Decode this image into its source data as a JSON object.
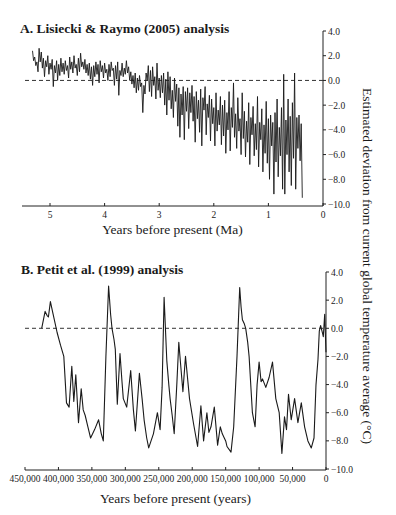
{
  "ylabel": "Estimated deviation from current global temperature average (°C)",
  "chart_data": [
    {
      "type": "line",
      "title": "A. Lisiecki & Raymo (2005) analysis",
      "xlabel": "Years before present (Ma)",
      "ylabel": "Estimated deviation from current global temperature average (°C)",
      "xlim": [
        5.5,
        0
      ],
      "ylim": [
        -10.0,
        4.0
      ],
      "xticks": [
        5,
        4,
        3,
        2,
        1,
        0
      ],
      "xtick_labels": [
        "5",
        "4",
        "3",
        "2",
        "1",
        "0"
      ],
      "yticks": [
        4.0,
        2.0,
        0.0,
        -2.0,
        -4.0,
        -6.0,
        -8.0,
        -10.0
      ],
      "ytick_labels": [
        "4.0",
        "2.0",
        "0.0",
        "−2.0",
        "−4.0",
        "−6.0",
        "−8.0",
        "−10.0"
      ],
      "reference_line": {
        "y": 0.0,
        "style": "dashed"
      },
      "grid": false,
      "series": [
        {
          "name": "Lisiecki & Raymo (2005)",
          "x": [
            5.32,
            5.3,
            5.28,
            5.26,
            5.24,
            5.22,
            5.2,
            5.18,
            5.16,
            5.14,
            5.12,
            5.1,
            5.08,
            5.06,
            5.04,
            5.02,
            5.0,
            4.98,
            4.96,
            4.94,
            4.92,
            4.9,
            4.88,
            4.86,
            4.84,
            4.82,
            4.8,
            4.78,
            4.76,
            4.74,
            4.72,
            4.7,
            4.68,
            4.66,
            4.64,
            4.62,
            4.6,
            4.58,
            4.56,
            4.54,
            4.52,
            4.5,
            4.48,
            4.46,
            4.44,
            4.42,
            4.4,
            4.38,
            4.36,
            4.34,
            4.32,
            4.3,
            4.28,
            4.26,
            4.24,
            4.22,
            4.2,
            4.18,
            4.16,
            4.14,
            4.12,
            4.1,
            4.08,
            4.06,
            4.04,
            4.02,
            4.0,
            3.98,
            3.96,
            3.94,
            3.92,
            3.9,
            3.88,
            3.86,
            3.84,
            3.82,
            3.8,
            3.78,
            3.76,
            3.74,
            3.72,
            3.7,
            3.68,
            3.66,
            3.64,
            3.62,
            3.6,
            3.58,
            3.56,
            3.54,
            3.52,
            3.5,
            3.48,
            3.46,
            3.44,
            3.42,
            3.4,
            3.38,
            3.36,
            3.34,
            3.32,
            3.3,
            3.28,
            3.26,
            3.24,
            3.22,
            3.2,
            3.18,
            3.16,
            3.14,
            3.12,
            3.1,
            3.08,
            3.06,
            3.04,
            3.02,
            3.0,
            2.98,
            2.96,
            2.94,
            2.92,
            2.9,
            2.88,
            2.86,
            2.84,
            2.82,
            2.8,
            2.78,
            2.76,
            2.74,
            2.72,
            2.7,
            2.68,
            2.66,
            2.64,
            2.62,
            2.6,
            2.58,
            2.56,
            2.54,
            2.52,
            2.5,
            2.48,
            2.46,
            2.44,
            2.42,
            2.4,
            2.38,
            2.36,
            2.34,
            2.32,
            2.3,
            2.28,
            2.26,
            2.24,
            2.22,
            2.2,
            2.18,
            2.16,
            2.14,
            2.12,
            2.1,
            2.08,
            2.06,
            2.04,
            2.02,
            2.0,
            1.98,
            1.96,
            1.94,
            1.92,
            1.9,
            1.88,
            1.86,
            1.84,
            1.82,
            1.8,
            1.78,
            1.76,
            1.74,
            1.72,
            1.7,
            1.68,
            1.66,
            1.64,
            1.62,
            1.6,
            1.58,
            1.56,
            1.54,
            1.52,
            1.5,
            1.48,
            1.46,
            1.44,
            1.42,
            1.4,
            1.38,
            1.36,
            1.34,
            1.32,
            1.3,
            1.28,
            1.26,
            1.24,
            1.22,
            1.2,
            1.18,
            1.16,
            1.14,
            1.12,
            1.1,
            1.08,
            1.06,
            1.04,
            1.02,
            1.0,
            0.98,
            0.96,
            0.94,
            0.92,
            0.9,
            0.88,
            0.86,
            0.84,
            0.82,
            0.8,
            0.78,
            0.76,
            0.74,
            0.72,
            0.7,
            0.68,
            0.66,
            0.64,
            0.62,
            0.6,
            0.58,
            0.56,
            0.54,
            0.52,
            0.5,
            0.48,
            0.46,
            0.44,
            0.42,
            0.4,
            0.38,
            0.36,
            0.34,
            0.32,
            0.3,
            0.28,
            0.26,
            0.24,
            0.22,
            0.2,
            0.18,
            0.16,
            0.14,
            0.12,
            0.1,
            0.08,
            0.06,
            0.04,
            0.02,
            0.0
          ],
          "y": [
            2.4,
            1.6,
            1.9,
            1.2,
            1.5,
            0.7,
            2.6,
            1.5,
            2.3,
            1.0,
            1.8,
            0.3,
            1.6,
            1.1,
            2.0,
            0.5,
            1.4,
            0.9,
            1.7,
            -0.5,
            1.2,
            0.6,
            1.6,
            0.0,
            1.3,
            0.4,
            1.8,
            0.7,
            1.4,
            0.5,
            1.6,
            0.8,
            1.2,
            0.2,
            1.9,
            0.9,
            1.5,
            0.6,
            2.0,
            1.0,
            1.3,
            0.4,
            1.8,
            0.7,
            2.2,
            1.1,
            1.5,
            0.9,
            1.7,
            0.6,
            1.3,
            0.4,
            1.4,
            0.1,
            1.1,
            -0.4,
            1.2,
            0.3,
            1.5,
            0.5,
            1.3,
            -0.2,
            1.6,
            0.7,
            1.2,
            0.2,
            1.4,
            0.6,
            0.9,
            0.0,
            1.3,
            0.3,
            1.5,
            0.8,
            1.0,
            -0.4,
            1.2,
            0.1,
            1.5,
            -1.2,
            0.8,
            0.4,
            1.4,
            0.3,
            1.0,
            0.5,
            1.6,
            0.6,
            1.1,
            0.0,
            0.7,
            -0.3,
            0.4,
            -0.6,
            0.6,
            -1.0,
            0.2,
            -0.8,
            0.4,
            -0.5,
            -0.2,
            -2.6,
            -0.4,
            -1.1,
            0.6,
            0.0,
            1.2,
            -0.9,
            0.8,
            -1.3,
            1.1,
            -0.4,
            0.3,
            -1.5,
            1.4,
            -0.8,
            0.2,
            -1.4,
            0.4,
            -1.0,
            0.6,
            -2.0,
            0.1,
            -2.8,
            0.7,
            -1.6,
            0.3,
            -2.3,
            -0.8,
            -3.0,
            0.2,
            -1.7,
            -0.3,
            -3.7,
            -0.6,
            -4.6,
            -1.1,
            -2.8,
            -0.5,
            -4.8,
            -0.9,
            -2.5,
            -0.6,
            -3.9,
            -1.0,
            -2.6,
            -0.4,
            -3.3,
            -1.3,
            -5.0,
            -0.9,
            -3.1,
            -1.6,
            -4.2,
            -0.7,
            -5.3,
            -1.4,
            -2.4,
            -0.5,
            -4.4,
            -1.9,
            -3.0,
            -1.2,
            -4.9,
            -1.5,
            -3.5,
            -2.2,
            -5.3,
            -1.0,
            -4.1,
            -2.4,
            -3.6,
            -1.3,
            -5.2,
            -2.0,
            -4.5,
            -1.6,
            -5.9,
            -2.6,
            -4.0,
            -0.9,
            -5.7,
            -2.2,
            -3.8,
            -0.2,
            -4.6,
            -2.7,
            -5.5,
            -1.4,
            -4.1,
            -3.1,
            -6.0,
            -1.0,
            -4.7,
            -2.5,
            -6.2,
            -3.3,
            -5.0,
            -1.8,
            -6.8,
            -3.0,
            -4.4,
            -2.1,
            -6.1,
            -3.5,
            -5.6,
            -1.3,
            -7.0,
            -3.4,
            -4.8,
            -2.3,
            -7.4,
            -3.6,
            -5.9,
            -1.7,
            -6.7,
            -3.1,
            -8.0,
            -2.8,
            -5.3,
            -3.4,
            -9.2,
            -2.6,
            -6.6,
            -1.5,
            -7.8,
            -3.8,
            -6.1,
            -2.2,
            -8.8,
            0.5,
            -9.2,
            -3.2,
            -6.0,
            -1.5,
            -7.4,
            -2.9,
            -8.5,
            -1.8,
            -6.3,
            0.6,
            -8.8,
            -3.0,
            -5.5,
            -2.8,
            -6.5,
            -3.5,
            -9.5
          ]
        }
      ]
    },
    {
      "type": "line",
      "title": "B. Petit et al. (1999) analysis",
      "xlabel": "Years before present (years)",
      "ylabel": "Estimated deviation from current global temperature average (°C)",
      "xlim": [
        450000,
        0
      ],
      "ylim": [
        -10.0,
        4.0
      ],
      "xticks": [
        450000,
        400000,
        350000,
        300000,
        250000,
        200000,
        150000,
        100000,
        50000,
        0
      ],
      "xtick_labels": [
        "450,000",
        "400,000",
        "350,000",
        "300,000",
        "250,000",
        "200,000",
        "150,000",
        "100,000",
        "50,000",
        "0"
      ],
      "yticks": [
        4.0,
        2.0,
        0.0,
        -2.0,
        -4.0,
        -6.0,
        -8.0,
        -10.0
      ],
      "ytick_labels": [
        "4.0",
        "2.0",
        "0.0",
        "−2.0",
        "−4.0",
        "−6.0",
        "−8.0",
        "−10.0"
      ],
      "reference_line": {
        "y": 0.0,
        "style": "dashed"
      },
      "grid": false,
      "series": [
        {
          "name": "Petit et al. (1999)",
          "x": [
            425000,
            420000,
            417000,
            415000,
            412000,
            408000,
            402000,
            397000,
            392000,
            388000,
            384000,
            380000,
            377000,
            374000,
            370000,
            366000,
            363000,
            360000,
            356000,
            352000,
            346000,
            340000,
            336000,
            333000,
            329000,
            325000,
            322000,
            320000,
            317000,
            315000,
            312000,
            308000,
            305000,
            303000,
            298000,
            292000,
            288000,
            285000,
            279000,
            275000,
            272000,
            268000,
            265000,
            258000,
            252000,
            248000,
            245000,
            242000,
            238000,
            235000,
            233000,
            230000,
            227000,
            223000,
            220000,
            217000,
            214000,
            210000,
            207000,
            204000,
            198000,
            192000,
            187000,
            183000,
            178000,
            175000,
            172000,
            167000,
            162000,
            158000,
            155000,
            150000,
            148000,
            142000,
            138000,
            133000,
            129000,
            127000,
            125000,
            122000,
            120000,
            117000,
            115000,
            110000,
            106000,
            103000,
            100000,
            97000,
            95000,
            90000,
            85000,
            80000,
            75000,
            70000,
            66000,
            62000,
            59000,
            56000,
            52000,
            47000,
            42000,
            37000,
            32000,
            27000,
            22000,
            18000,
            15000,
            12000,
            10000,
            8000,
            7000,
            5000,
            4000,
            2000,
            0
          ],
          "y": [
            0.0,
            1.2,
            0.9,
            0.8,
            1.9,
            1.0,
            -0.3,
            -1.2,
            -2.0,
            -5.3,
            -5.6,
            -2.7,
            -5.2,
            -3.3,
            -6.7,
            -4.3,
            -5.8,
            -6.2,
            -7.0,
            -7.8,
            -7.2,
            -6.5,
            -7.5,
            -8.0,
            -2.0,
            3.0,
            1.0,
            0.0,
            -0.8,
            -1.5,
            -5.4,
            -1.8,
            -3.8,
            -5.0,
            -5.6,
            -3.0,
            -5.8,
            -7.3,
            -3.2,
            -5.0,
            -6.5,
            -7.8,
            -8.5,
            -7.5,
            -6.0,
            -7.2,
            -4.2,
            2.2,
            -2.3,
            -4.0,
            -5.0,
            -6.2,
            -7.5,
            -4.0,
            -1.0,
            -2.8,
            -4.5,
            -2.0,
            -3.5,
            -5.0,
            -6.8,
            -8.4,
            -5.5,
            -8.0,
            -6.0,
            -7.4,
            -7.0,
            -5.6,
            -8.3,
            -7.0,
            -7.5,
            -8.0,
            -8.4,
            -8.8,
            -7.0,
            -2.0,
            2.9,
            1.5,
            0.6,
            0.3,
            0.0,
            -1.0,
            -2.0,
            -6.0,
            -7.0,
            -4.0,
            -2.4,
            -3.8,
            -3.6,
            -4.2,
            -3.5,
            -2.4,
            -5.0,
            -6.0,
            -8.9,
            -6.3,
            -7.2,
            -4.7,
            -6.5,
            -5.0,
            -6.7,
            -5.3,
            -7.0,
            -8.0,
            -8.5,
            -7.8,
            -4.0,
            -2.2,
            -0.2,
            0.2,
            0.0,
            -0.4,
            -0.6,
            1.0,
            -1.7
          ]
        }
      ]
    }
  ]
}
